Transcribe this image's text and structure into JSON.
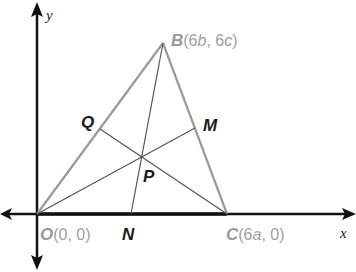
{
  "diagram": {
    "axes": {
      "x_label": "x",
      "y_label": "y"
    },
    "vertices": {
      "O": {
        "name": "O",
        "coords": "(0, 0)"
      },
      "B": {
        "name": "B",
        "coords_prefix": "(6",
        "var1": "b",
        "sep": ", 6",
        "var2": "c",
        "suffix": ")"
      },
      "C": {
        "name": "C",
        "coords_prefix": "(6",
        "var1": "a",
        "suffix": ", 0)"
      }
    },
    "midpoints": {
      "Q": "Q",
      "M": "M",
      "N": "N"
    },
    "centroid": "P",
    "segments": [
      "OB",
      "BC",
      "OC",
      "BN",
      "OM",
      "CQ"
    ],
    "colors": {
      "axis": "#111111",
      "triangle": "#9a9a9a",
      "median": "#555555",
      "vertex_label": "#9a9a9a",
      "point_label": "#1a1a1a"
    }
  }
}
